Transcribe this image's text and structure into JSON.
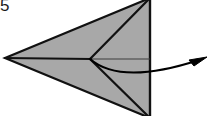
{
  "figure": {
    "kind": "origami-fold-diagram",
    "width": 212,
    "height": 116,
    "background_color": "#ffffff",
    "step_label": "5",
    "description_alt": "Origami step 5: gray kite-shaped folded paper with crease lines and a curved arrow pointing right"
  },
  "colors": {
    "paper_fill": "#a8a8a8",
    "outline_stroke": "#111111",
    "crease_stroke": "#111111",
    "thin_crease_stroke": "#3c3c3c",
    "arrow_stroke": "#000000",
    "label_color": "#1a1a1a",
    "background": "#ffffff"
  },
  "geometry": {
    "left_apex": {
      "x": 5,
      "y": 58
    },
    "top_vertex": {
      "x": 150,
      "y": -2
    },
    "bottom_vertex": {
      "x": 150,
      "y": 118
    },
    "center_vertex": {
      "x": 90,
      "y": 59
    },
    "right_edge_top": {
      "x": 150,
      "y": -2
    },
    "right_edge_bottom": {
      "x": 150,
      "y": 118
    },
    "paper_outline_points": "5,58 150,-2 150,118",
    "crease_horizontal": {
      "x1": 5,
      "y1": 58,
      "x2": 90,
      "y2": 59
    },
    "crease_upper_diagonal": {
      "x1": 90,
      "y1": 59,
      "x2": 150,
      "y2": -2
    },
    "crease_lower_diagonal": {
      "x1": 90,
      "y1": 59,
      "x2": 150,
      "y2": 118
    },
    "thin_line_to_right_edge": {
      "x1": 90,
      "y1": 59,
      "x2": 150,
      "y2": 59
    }
  },
  "arrow": {
    "name": "fold-direction-arrow",
    "path": "M 90,59 C 112,78 150,76 199,60",
    "head_tip": {
      "x": 207,
      "y": 57
    },
    "head_points": "207,57 189,60 194,66",
    "stroke_width": 2.1,
    "direction": "right"
  },
  "label": {
    "text": "5",
    "x": 0,
    "y": -1,
    "font_size": 17
  }
}
